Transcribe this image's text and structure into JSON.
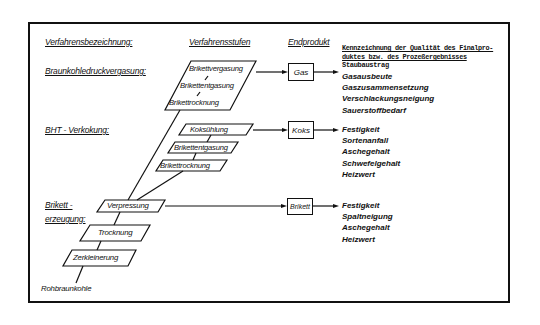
{
  "headers": {
    "process_name": "Verfahrensbezeichnung:",
    "process_stages": "Verfahrensstufen",
    "end_product": "Endprodukt",
    "quality_line1": "Kennzeichnung der Qualität des Finalpro-",
    "quality_line2": "duktes bzw. des Prozeßergebnisses"
  },
  "processes": {
    "gasification": "Braunkohledruckvergasung:",
    "coking": "BHT - Verkokung:",
    "briquetting_line1": "Brikett -",
    "briquetting_line2": "erzeugung:"
  },
  "stages": {
    "gas_group": [
      "Brikettvergasung",
      "Brikettentgasung",
      "Brikettrocknung"
    ],
    "coke_group": [
      "Koksühlung",
      "Brikettentgasung",
      "Brikettrocknung"
    ],
    "base": [
      "Verpressung",
      "Trocknung",
      "Zerkleinerung"
    ],
    "raw_material": "Rohbraunkohle"
  },
  "products": {
    "gas": "Gas",
    "coke": "Koks",
    "briquette": "Brikett"
  },
  "quality": {
    "gas": [
      "Staubaustrag",
      "Gasausbeute",
      "Gaszusammensetzung",
      "Verschlackungsneigung",
      "Sauerstoffbedarf"
    ],
    "coke": [
      "Festigkeit",
      "Sortenanfall",
      "Aschegehalt",
      "Schwefelgehalt",
      "Heizwert"
    ],
    "briquette": [
      "Festigkeit",
      "Spaltneigung",
      "Aschegehalt",
      "Heizwert"
    ]
  }
}
